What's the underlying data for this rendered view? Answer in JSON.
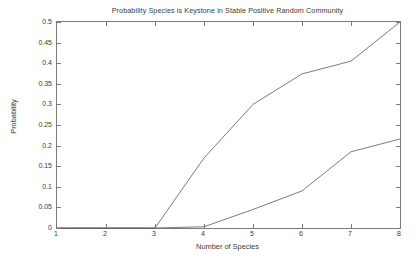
{
  "chart_data": {
    "type": "line",
    "title": "Probability Species is Keystone in Stable Positive Random Community",
    "xlabel": "Number of Species",
    "ylabel": "Probability",
    "xlim": [
      1,
      8
    ],
    "ylim": [
      0,
      0.5
    ],
    "grid": false,
    "legend": "none",
    "x": [
      1,
      2,
      3,
      4,
      5,
      6,
      7,
      8
    ],
    "xticks": [
      "1",
      "2",
      "3",
      "4",
      "5",
      "6",
      "7",
      "8"
    ],
    "yticks": [
      "0",
      "0.05",
      "0.1",
      "0.15",
      "0.2",
      "0.25",
      "0.3",
      "0.35",
      "0.4",
      "0.45",
      "0.5"
    ],
    "ytick_values": [
      0,
      0.05,
      0.1,
      0.15,
      0.2,
      0.25,
      0.3,
      0.35,
      0.4,
      0.45,
      0.5
    ],
    "series": [
      {
        "name": "upper-curve",
        "color": "#5a5a5a",
        "values": [
          0,
          0,
          0,
          0.17,
          0.3,
          0.374,
          0.405,
          0.5
        ]
      },
      {
        "name": "lower-curve",
        "color": "#5a5a5a",
        "values": [
          0,
          0,
          0,
          0.003,
          0.045,
          0.09,
          0.185,
          0.216
        ]
      }
    ]
  },
  "colors": {
    "axis": "#7b7b7b",
    "text": "#3a3a3a",
    "background": "#ffffff",
    "line": "#5a5a5a"
  }
}
